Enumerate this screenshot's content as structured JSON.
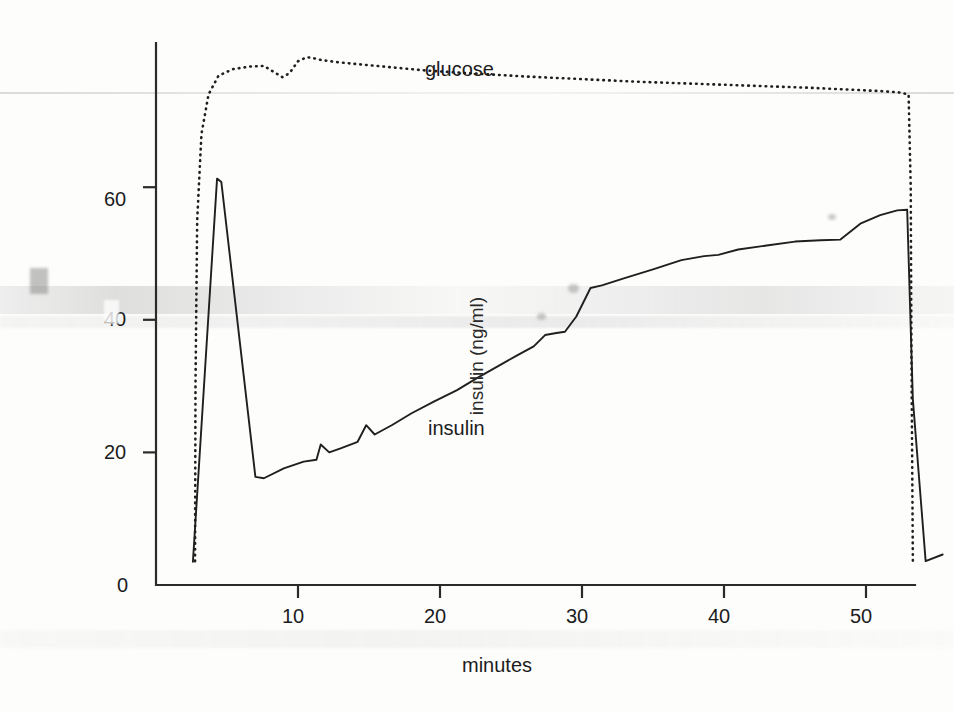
{
  "chart_data": {
    "type": "line",
    "title": "",
    "xlabel": "minutes",
    "ylabel": "insulin (ng/ml)",
    "xlim": [
      0,
      57
    ],
    "ylim": [
      0,
      88
    ],
    "xticks": [
      10,
      20,
      30,
      40,
      50
    ],
    "yticks": [
      0,
      20,
      40,
      60
    ],
    "grid": false,
    "legend_position": "inline-annotations",
    "series": [
      {
        "name": "insulin",
        "style": "solid",
        "label_annotation": "insulin",
        "x": [
          2.6,
          4.3,
          4.6,
          7.0,
          7.6,
          9.0,
          10.4,
          11.3,
          11.6,
          12.2,
          13.0,
          14.2,
          14.8,
          15.4,
          16.6,
          18.0,
          19.6,
          21.2,
          22.6,
          24.0,
          25.4,
          26.6,
          27.4,
          28.2,
          28.8,
          29.6,
          30.6,
          31.4,
          33.0,
          35.0,
          37.0,
          38.6,
          39.6,
          41.0,
          43.0,
          45.0,
          46.8,
          48.2,
          49.6,
          51.0,
          52.2,
          52.9,
          53.3,
          54.2,
          55.4
        ],
        "y": [
          3.5,
          61.3,
          60.8,
          16.3,
          16.1,
          17.6,
          18.6,
          18.9,
          21.2,
          20.0,
          20.6,
          21.6,
          24.1,
          22.7,
          24.1,
          25.9,
          27.7,
          29.4,
          31.2,
          32.9,
          34.6,
          36.0,
          37.7,
          38.0,
          38.2,
          40.5,
          44.8,
          45.2,
          46.3,
          47.6,
          49.0,
          49.6,
          49.8,
          50.6,
          51.2,
          51.8,
          52.0,
          52.1,
          54.5,
          55.8,
          56.5,
          56.6,
          28.0,
          3.6,
          4.6
        ]
      },
      {
        "name": "glucose",
        "style": "dotted",
        "label_annotation": "glucose",
        "x": [
          2.75,
          2.78,
          2.9,
          3.2,
          3.7,
          4.4,
          5.4,
          6.6,
          7.6,
          8.2,
          8.9,
          9.4,
          10.0,
          10.6,
          11.0,
          11.6,
          12.6,
          14.0,
          16.0,
          19.0,
          22.0,
          26.0,
          30.0,
          34.0,
          38.0,
          42.0,
          46.0,
          49.0,
          51.0,
          52.3,
          53.0,
          53.15,
          53.2,
          53.3
        ],
        "y": [
          3.6,
          30.0,
          55.0,
          68.0,
          74.0,
          76.8,
          77.8,
          78.2,
          78.3,
          77.5,
          76.6,
          77.2,
          79.0,
          79.6,
          79.5,
          79.2,
          78.9,
          78.6,
          78.2,
          77.6,
          77.2,
          76.7,
          76.3,
          75.9,
          75.6,
          75.3,
          75.0,
          74.7,
          74.5,
          74.3,
          74.0,
          60.0,
          35.0,
          3.6
        ]
      }
    ],
    "annotations": [
      {
        "text": "glucose",
        "x_px": 425,
        "y_px": 60
      },
      {
        "text": "insulin",
        "x_px": 428,
        "y_px": 418
      }
    ]
  },
  "axes": {
    "y_tick_labels": [
      "60",
      "40",
      "20",
      "0"
    ],
    "y_tick_values": [
      60,
      40,
      20,
      0
    ],
    "x_tick_labels": [
      "10",
      "20",
      "30",
      "40",
      "50"
    ],
    "x_tick_values": [
      10,
      20,
      30,
      40,
      50
    ],
    "x_title": "minutes",
    "y_title": "insulin (ng/ml)"
  },
  "style": {
    "line_color": "#1f1f1f",
    "axis_color": "#2b2b2b",
    "background": "#fdfdfc",
    "text_color": "#1c1c1c"
  }
}
